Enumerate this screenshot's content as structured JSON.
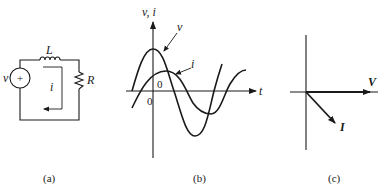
{
  "panels": {
    "a": {
      "caption": "(a)",
      "source_label": "v",
      "source_sign": "+",
      "inductor_label": "L",
      "resistor_label": "R",
      "current_label": "i"
    },
    "b": {
      "caption": "(b)",
      "y_axis_label": "v, i",
      "x_axis_label": "t",
      "v_curve_label": "v",
      "i_curve_label": "i",
      "origin_label_v": "0",
      "origin_label_i": "0"
    },
    "c": {
      "caption": "(c)",
      "voltage_phasor_label": "V",
      "current_phasor_label": "I"
    }
  },
  "colors": {
    "ink": "#1a1a1a",
    "background": "#ffffff"
  }
}
